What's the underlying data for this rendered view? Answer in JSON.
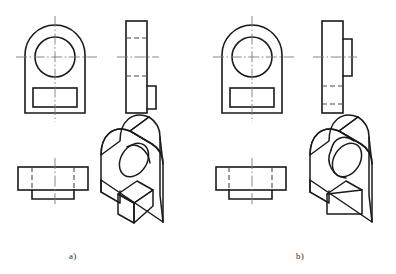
{
  "figure": {
    "type": "engineering-drawing",
    "background_color": "#ffffff",
    "line_color": "#1a1a1a",
    "hidden_line_color": "#4a4a4a",
    "center_line_color": "#7a7a7a"
  },
  "panels": [
    {
      "id": "a",
      "caption": "a)",
      "views": [
        {
          "name": "front-view",
          "outline": "rounded-top rectangle",
          "features": [
            "circular through hole",
            "rectangular slot"
          ]
        },
        {
          "name": "side-view",
          "outline": "tall rectangle",
          "features": [
            "boss at lower right",
            "two hidden lines"
          ]
        },
        {
          "name": "top-view",
          "outline": "wide rectangle with lower tab",
          "features": [
            "two hidden lines",
            "vertical center line"
          ]
        },
        {
          "name": "isometric-view",
          "features": [
            "through hole",
            "raised rectangular block"
          ]
        }
      ]
    },
    {
      "id": "b",
      "caption": "b)",
      "views": [
        {
          "name": "front-view",
          "outline": "rounded-top rectangle",
          "features": [
            "circular through hole",
            "rectangular slot"
          ]
        },
        {
          "name": "side-view",
          "outline": "tall rectangle",
          "features": [
            "boss at middle right",
            "two hidden lines"
          ]
        },
        {
          "name": "top-view",
          "outline": "wide rectangle with lower tab",
          "features": [
            "two hidden lines",
            "vertical center line"
          ]
        },
        {
          "name": "isometric-view",
          "features": [
            "protruding cylindrical boss",
            "recessed rectangular slot"
          ]
        }
      ]
    }
  ],
  "captions": {
    "a": "a)",
    "b": "b)"
  }
}
